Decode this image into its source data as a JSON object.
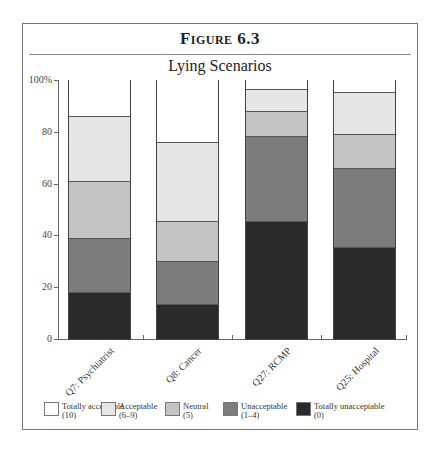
{
  "figure": {
    "label": "Figure 6.3",
    "title": "Lying Scenarios"
  },
  "colors": {
    "totally_acceptable": "#ffffff",
    "acceptable": "#e6e6e6",
    "neutral": "#c4c4c4",
    "unacceptable": "#7c7c7c",
    "totally_unacceptable": "#2a2a2a"
  },
  "y_ticks": [
    "0",
    "20",
    "40",
    "60",
    "80",
    "100%"
  ],
  "legend": [
    {
      "line1": "Totally acceptable",
      "line2": "(10)",
      "key": "totally_acceptable"
    },
    {
      "line1": "Acceptable",
      "line2": "(6–9)",
      "key": "acceptable"
    },
    {
      "line1": "Neutral",
      "line2": "(5)",
      "key": "neutral"
    },
    {
      "line1": "Unacceptable",
      "line2": "(1–4)",
      "key": "unacceptable"
    },
    {
      "line1": "Totally unacceptable",
      "line2": "(0)",
      "key": "totally_unacceptable"
    }
  ],
  "chart_data": {
    "type": "bar",
    "stacked": true,
    "title": "Lying Scenarios",
    "figure_label": "Figure 6.3",
    "xlabel": "",
    "ylabel": "",
    "ylim": [
      0,
      100
    ],
    "y_ticks": [
      0,
      20,
      40,
      60,
      80,
      100
    ],
    "grid": false,
    "legend_position": "bottom",
    "categories": [
      "Q7: Psychiatrist",
      "Q8: Cancer",
      "Q27: RCMP",
      "Q25: Hospital"
    ],
    "series": [
      {
        "name": "Totally unacceptable (0)",
        "values": [
          18,
          13.5,
          45.5,
          35.5
        ]
      },
      {
        "name": "Unacceptable (1–4)",
        "values": [
          21,
          16.5,
          33,
          30.5
        ]
      },
      {
        "name": "Neutral (5)",
        "values": [
          22,
          15.5,
          9.5,
          13
        ]
      },
      {
        "name": "Acceptable (6–9)",
        "values": [
          25,
          30.5,
          8.5,
          16.5
        ]
      },
      {
        "name": "Totally acceptable (10)",
        "values": [
          14,
          24,
          3.5,
          4.5
        ]
      }
    ]
  }
}
